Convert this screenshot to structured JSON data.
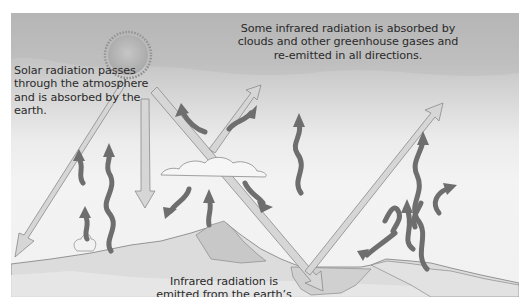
{
  "diagram": {
    "labels": {
      "solar": "Solar radiation passes through the atmosphere and is absorbed by the earth.",
      "absorbed": "Some infrared radiation is absorbed by clouds and other greenhouse gases and re-emitted in all directions.",
      "emitted": "Infrared radiation is emitted from the earth’s surface."
    },
    "elements": {
      "sun": "sun-icon",
      "cloud": "cloud-icon",
      "solar_arrows": "solar-radiation-arrow",
      "infrared_arrows": "infrared-radiation-arrow",
      "ground": "earth-surface",
      "mountain": "mountain",
      "water": "water-body",
      "volcano_smoke": "smoke-plume"
    },
    "colors": {
      "sky_top": "#b9b9b9",
      "sky_bottom": "#f1f1f1",
      "solar_arrow_fill": "#d6d6d6",
      "solar_arrow_stroke": "#8a8a8a",
      "infrared_arrow": "#6e6e6e",
      "ground": "#d9d9d9"
    }
  }
}
